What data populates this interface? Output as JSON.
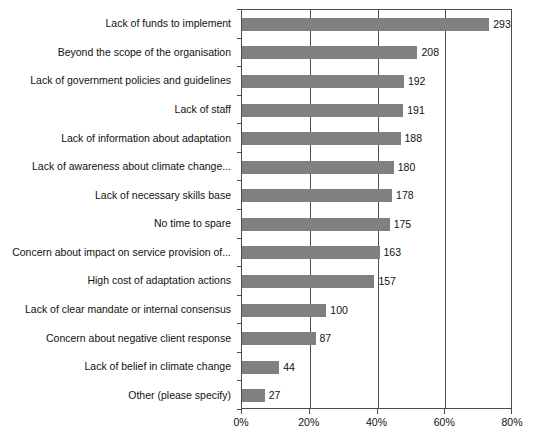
{
  "chart_data": {
    "type": "bar",
    "orientation": "horizontal",
    "title": "",
    "subtitle": "",
    "xlabel": "",
    "ylabel": "",
    "xlim": [
      0,
      80
    ],
    "xtick_labels": [
      "0%",
      "20%",
      "40%",
      "60%",
      "80%"
    ],
    "xtick_values": [
      0,
      20,
      40,
      60,
      80
    ],
    "grid": true,
    "gridlines_at": [
      20,
      40,
      60
    ],
    "legend": null,
    "bar_color": "#808080",
    "axis_color": "#4d4d4d",
    "text_color": "#111111",
    "background": "#ffffff",
    "categories": [
      "Lack of funds to implement",
      "Beyond the scope of the organisation",
      "Lack of government policies and guidelines",
      "Lack of staff",
      "Lack of information about adaptation",
      "Lack of awareness about climate change...",
      "Lack of necessary skills base",
      "No time to spare",
      "Concern about impact on service provision of...",
      "High cost of adaptation actions",
      "Lack of clear mandate or internal consensus",
      "Concern about negative client response",
      "Lack of belief in climate change",
      "Other (please specify)"
    ],
    "values": [
      293,
      208,
      192,
      191,
      188,
      180,
      178,
      175,
      163,
      157,
      100,
      87,
      44,
      27
    ],
    "value_labels": [
      "293",
      "208",
      "192",
      "191",
      "188",
      "180",
      "178",
      "175",
      "163",
      "157",
      "100",
      "87",
      "44",
      "27"
    ],
    "percents": [
      73.0,
      51.8,
      47.8,
      47.6,
      46.8,
      44.8,
      44.3,
      43.6,
      40.6,
      39.1,
      24.9,
      21.7,
      11.0,
      6.7
    ]
  }
}
